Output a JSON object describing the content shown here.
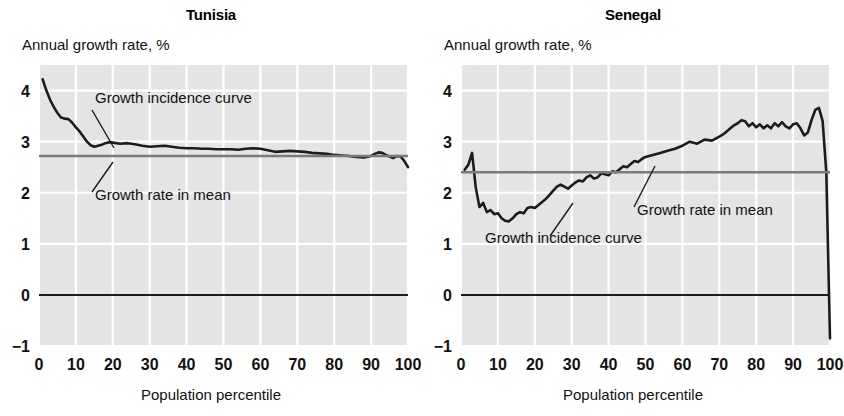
{
  "figure": {
    "background": "#ffffff",
    "plot_background": "#e4e4e4",
    "gridline_color": "#ffffff",
    "curve_color": "#1c1c1c",
    "mean_line_color": "#7a7a7a",
    "zero_line_color": "#1c1c1c"
  },
  "panels": [
    {
      "key": "tunisia",
      "title": "Tunisia",
      "y_caption": "Annual growth rate, %",
      "x_caption": "Population percentile",
      "annotations": {
        "curve_label": "Growth incidence curve",
        "mean_label": "Growth rate in mean"
      }
    },
    {
      "key": "senegal",
      "title": "Senegal",
      "y_caption": "Annual growth rate, %",
      "x_caption": "Population percentile",
      "annotations": {
        "curve_label": "Growth incidence curve",
        "mean_label": "Growth rate in mean"
      }
    }
  ],
  "chart_data": [
    {
      "type": "line",
      "title": "Tunisia",
      "xlabel": "Population percentile",
      "ylabel": "Annual growth rate, %",
      "xlim": [
        0,
        100
      ],
      "ylim": [
        -1,
        4.5
      ],
      "xticks": [
        0,
        10,
        20,
        30,
        40,
        50,
        60,
        70,
        80,
        90,
        100
      ],
      "xtick_labels": [
        "0",
        "10",
        "20",
        "30",
        "40",
        "50",
        "60",
        "70",
        "80",
        "90",
        "100"
      ],
      "yticks": [
        -1,
        0,
        1,
        2,
        3,
        4
      ],
      "ytick_labels": [
        "−1",
        "0",
        "1",
        "2",
        "3",
        "4"
      ],
      "grid": true,
      "legend": "none",
      "annotations": [
        {
          "text": "Growth incidence curve",
          "x": 14,
          "y": 3.62
        },
        {
          "text": "Growth rate in mean",
          "x": 12,
          "y": 2.08
        }
      ],
      "series": [
        {
          "name": "Growth incidence curve",
          "x": [
            1,
            2,
            3,
            4,
            5,
            6,
            7,
            8,
            9,
            10,
            11,
            12,
            13,
            14,
            15,
            16,
            17,
            18,
            19,
            20,
            22,
            24,
            26,
            28,
            30,
            32,
            34,
            36,
            38,
            40,
            42,
            44,
            46,
            48,
            50,
            52,
            54,
            56,
            58,
            60,
            62,
            64,
            66,
            68,
            70,
            72,
            74,
            76,
            78,
            80,
            82,
            84,
            86,
            88,
            90,
            91,
            92,
            93,
            94,
            95,
            96,
            97,
            98,
            99,
            100
          ],
          "values": [
            4.22,
            4.0,
            3.82,
            3.68,
            3.56,
            3.47,
            3.45,
            3.44,
            3.37,
            3.28,
            3.2,
            3.1,
            3.0,
            2.93,
            2.9,
            2.92,
            2.94,
            2.97,
            2.99,
            2.98,
            2.96,
            2.97,
            2.95,
            2.92,
            2.9,
            2.91,
            2.92,
            2.9,
            2.88,
            2.87,
            2.87,
            2.86,
            2.86,
            2.85,
            2.85,
            2.85,
            2.84,
            2.86,
            2.87,
            2.86,
            2.83,
            2.8,
            2.81,
            2.82,
            2.81,
            2.8,
            2.78,
            2.77,
            2.76,
            2.74,
            2.73,
            2.72,
            2.7,
            2.69,
            2.72,
            2.76,
            2.79,
            2.78,
            2.74,
            2.71,
            2.68,
            2.72,
            2.71,
            2.62,
            2.5
          ]
        },
        {
          "name": "Growth rate in mean",
          "constant": 2.72
        }
      ]
    },
    {
      "type": "line",
      "title": "Senegal",
      "xlabel": "Population percentile",
      "ylabel": "Annual growth rate, %",
      "xlim": [
        0,
        100
      ],
      "ylim": [
        -1,
        4.5
      ],
      "xticks": [
        0,
        10,
        20,
        30,
        40,
        50,
        60,
        70,
        80,
        90,
        100
      ],
      "xtick_labels": [
        "0",
        "10",
        "20",
        "30",
        "40",
        "50",
        "60",
        "70",
        "80",
        "90",
        "100"
      ],
      "yticks": [
        -1,
        0,
        1,
        2,
        3,
        4
      ],
      "ytick_labels": [
        "−1",
        "0",
        "1",
        "2",
        "3",
        "4"
      ],
      "grid": true,
      "legend": "none",
      "annotations": [
        {
          "text": "Growth rate in mean",
          "x": 52,
          "y": 1.72
        },
        {
          "text": "Growth incidence curve",
          "x": 17,
          "y": 1.12
        }
      ],
      "series": [
        {
          "name": "Growth incidence curve",
          "x": [
            1,
            2,
            3,
            4,
            5,
            6,
            7,
            8,
            9,
            10,
            11,
            12,
            13,
            14,
            15,
            16,
            17,
            18,
            19,
            20,
            21,
            22,
            23,
            24,
            25,
            26,
            27,
            28,
            29,
            30,
            31,
            32,
            33,
            34,
            35,
            36,
            37,
            38,
            39,
            40,
            41,
            42,
            43,
            44,
            45,
            46,
            47,
            48,
            49,
            50,
            52,
            54,
            56,
            58,
            60,
            62,
            64,
            66,
            68,
            70,
            71,
            72,
            73,
            74,
            75,
            76,
            77,
            78,
            79,
            80,
            81,
            82,
            83,
            84,
            85,
            86,
            87,
            88,
            89,
            90,
            91,
            92,
            93,
            94,
            95,
            96,
            97,
            98,
            99,
            100
          ],
          "values": [
            2.45,
            2.55,
            2.78,
            2.1,
            1.72,
            1.8,
            1.62,
            1.66,
            1.58,
            1.6,
            1.5,
            1.45,
            1.44,
            1.5,
            1.58,
            1.62,
            1.6,
            1.7,
            1.72,
            1.7,
            1.76,
            1.82,
            1.88,
            1.96,
            2.04,
            2.12,
            2.16,
            2.12,
            2.08,
            2.14,
            2.2,
            2.24,
            2.22,
            2.3,
            2.34,
            2.28,
            2.3,
            2.38,
            2.36,
            2.34,
            2.42,
            2.4,
            2.46,
            2.52,
            2.5,
            2.56,
            2.62,
            2.6,
            2.66,
            2.7,
            2.74,
            2.78,
            2.82,
            2.86,
            2.92,
            3.0,
            2.96,
            3.04,
            3.02,
            3.1,
            3.14,
            3.2,
            3.26,
            3.32,
            3.36,
            3.42,
            3.4,
            3.3,
            3.36,
            3.28,
            3.34,
            3.26,
            3.32,
            3.26,
            3.36,
            3.3,
            3.38,
            3.3,
            3.26,
            3.34,
            3.36,
            3.26,
            3.12,
            3.18,
            3.42,
            3.62,
            3.66,
            3.4,
            2.4,
            -0.85
          ]
        },
        {
          "name": "Growth rate in mean",
          "constant": 2.4
        }
      ]
    }
  ]
}
